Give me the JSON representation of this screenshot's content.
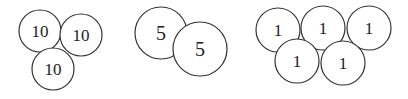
{
  "groups": [
    {
      "name": "tens",
      "coins": [
        {
          "label": "10",
          "cx": 40,
          "cy": 31,
          "r": 21
        },
        {
          "label": "10",
          "cx": 81,
          "cy": 35,
          "r": 21
        },
        {
          "label": "10",
          "cx": 53,
          "cy": 69,
          "r": 21
        }
      ]
    },
    {
      "name": "fives",
      "coins": [
        {
          "label": "5",
          "cx": 161,
          "cy": 33,
          "r": 26
        },
        {
          "label": "5",
          "cx": 200,
          "cy": 49,
          "r": 27
        }
      ]
    },
    {
      "name": "ones",
      "coins": [
        {
          "label": "1",
          "cx": 278,
          "cy": 30,
          "r": 22
        },
        {
          "label": "1",
          "cx": 323,
          "cy": 28,
          "r": 22
        },
        {
          "label": "1",
          "cx": 369,
          "cy": 28,
          "r": 22
        },
        {
          "label": "1",
          "cx": 297,
          "cy": 61,
          "r": 22
        },
        {
          "label": "1",
          "cx": 343,
          "cy": 63,
          "r": 22
        }
      ]
    }
  ]
}
